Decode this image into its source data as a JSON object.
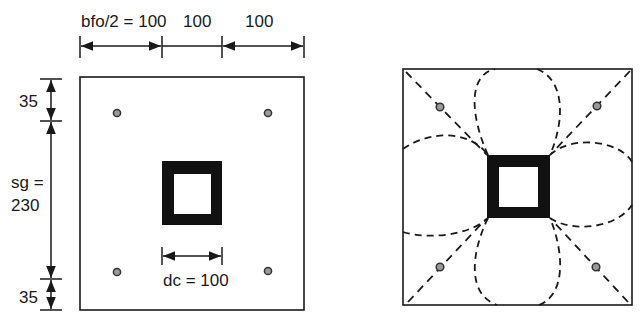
{
  "left_figure": {
    "dimensions_top": [
      "bfo/2 = 100",
      "100",
      "100"
    ],
    "dimensions_left": {
      "top": "35",
      "middle_line1": "sg =",
      "middle_line2": "230",
      "bottom": "35"
    },
    "column_dimension": "dc = 100",
    "bolt_count": 4
  },
  "right_figure": {
    "description": "Yield line pattern: diagonal dashed lines from plate corners through bolts to column corners, four dashed elliptical arcs around column",
    "bolt_count": 4
  },
  "colors": {
    "line": "#1a1a1a",
    "bolt_fill": "#9a9a9a",
    "column_fill": "#111111",
    "background": "#ffffff"
  }
}
